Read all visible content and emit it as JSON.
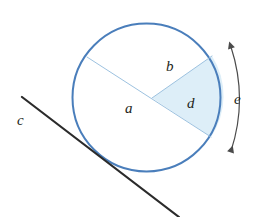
{
  "diagram": {
    "kind": "circle-geometry-diagram",
    "canvas": {
      "width": 259,
      "height": 217,
      "background": "#ffffff"
    },
    "colors": {
      "circle_stroke": "#4a7ebb",
      "chord_stroke": "#9dc2e0",
      "sector_fill": "#ddeef8",
      "tangent_stroke": "#2b2b2b",
      "arrow_stroke": "#4b4b4b",
      "label_text": "#231f20"
    },
    "circle": {
      "name": "main-circle",
      "center_x": 146.5,
      "center_y": 97.5,
      "radius": 74,
      "stroke_width": 2
    },
    "chord_a": {
      "name": "diameter-chord-a",
      "x1": 87,
      "y1": 57,
      "x2": 211,
      "y2": 137,
      "stroke_width": 1
    },
    "radius_b": {
      "name": "radius-b",
      "x1": 152,
      "y1": 98,
      "x2": 212,
      "y2": 56,
      "stroke_width": 1
    },
    "sector_d": {
      "name": "shaded-sector-d",
      "vertex_x": 152,
      "vertex_y": 98,
      "arc_start_x": 212,
      "arc_start_y": 56,
      "arc_end_x": 211,
      "arc_end_y": 137
    },
    "tangent_c": {
      "name": "tangent-line-c",
      "x1": 22,
      "y1": 97,
      "x2": 179,
      "y2": 217,
      "stroke_width": 2.2,
      "touch_x": 101,
      "touch_y": 162
    },
    "arc_arrow_e": {
      "name": "arc-measure-arrow-e",
      "start_x": 231,
      "start_y": 47,
      "end_x": 231,
      "end_y": 151,
      "bow_x": 246,
      "bow_y": 99,
      "stroke_width": 1.2,
      "double_headed": true
    },
    "labels": [
      {
        "id": "label-a",
        "text": "a",
        "x": 125,
        "y": 101,
        "note": "diameter / chord"
      },
      {
        "id": "label-b",
        "text": "b",
        "x": 166,
        "y": 59,
        "note": "radius bounding sector"
      },
      {
        "id": "label-c",
        "text": "c",
        "x": 17,
        "y": 113,
        "note": "tangent line"
      },
      {
        "id": "label-d",
        "text": "d",
        "x": 187,
        "y": 96,
        "note": "shaded sector"
      },
      {
        "id": "label-e",
        "text": "e",
        "x": 234,
        "y": 92,
        "note": "arc measure"
      }
    ]
  }
}
